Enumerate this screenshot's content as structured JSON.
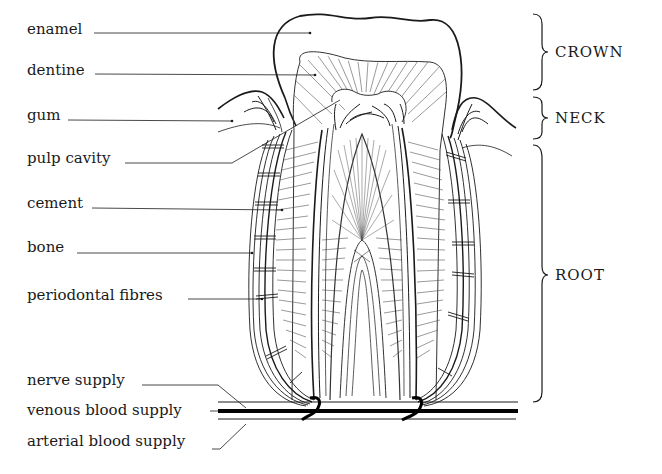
{
  "diagram": {
    "colors": {
      "ink": "#1a1a1a",
      "background": "#ffffff"
    },
    "labels": [
      {
        "id": "enamel",
        "text": "enamel"
      },
      {
        "id": "dentine",
        "text": "dentine"
      },
      {
        "id": "gum",
        "text": "gum"
      },
      {
        "id": "pulp-cavity",
        "text": "pulp cavity"
      },
      {
        "id": "cement",
        "text": "cement"
      },
      {
        "id": "bone",
        "text": "bone"
      },
      {
        "id": "periodontal-fibres",
        "text": "periodontal fibres"
      },
      {
        "id": "nerve-supply",
        "text": "nerve supply"
      },
      {
        "id": "venous-blood-supply",
        "text": "venous blood supply"
      },
      {
        "id": "arterial-blood-supply",
        "text": "arterial blood supply"
      }
    ],
    "regions": [
      {
        "id": "crown",
        "text": "CROWN"
      },
      {
        "id": "neck",
        "text": "NECK"
      },
      {
        "id": "root",
        "text": "ROOT"
      }
    ]
  }
}
